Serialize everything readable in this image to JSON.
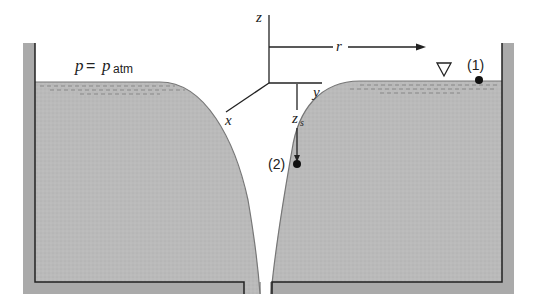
{
  "figure": {
    "type": "free-vortex drain diagram",
    "labels": {
      "pressure_lhs": "p",
      "pressure_eq": " = ",
      "pressure_rhs": "p",
      "pressure_sub": "atm",
      "axis_z": "z",
      "axis_r": "r",
      "axis_x": "x",
      "axis_y": "y",
      "depth_main": "z",
      "depth_sub": "s",
      "point_1": "(1)",
      "point_2": "(2)"
    },
    "symbols": {
      "free_surface_marker": "triangle-down-icon"
    },
    "colors": {
      "fluid": "#b9b9b9",
      "wall": "#a9a9a9",
      "line": "#222222",
      "background": "#ffffff"
    }
  }
}
